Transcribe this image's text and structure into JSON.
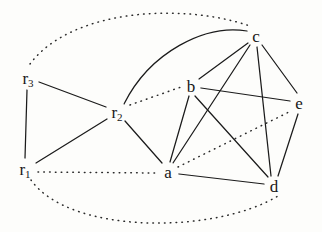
{
  "figure": {
    "width": 322,
    "height": 232,
    "background": "#fdfdfb",
    "stroke_color": "#1b1b1b",
    "dotted_color": "#2a2a2a"
  },
  "nodes": [
    {
      "id": "r3",
      "label": "r",
      "sub": "3",
      "x": 28,
      "y": 78
    },
    {
      "id": "r2",
      "label": "r",
      "sub": "2",
      "x": 117,
      "y": 112
    },
    {
      "id": "r1",
      "label": "r",
      "sub": "1",
      "x": 25,
      "y": 169
    },
    {
      "id": "b",
      "label": "b",
      "sub": "",
      "x": 191,
      "y": 86
    },
    {
      "id": "c",
      "label": "c",
      "sub": "",
      "x": 256,
      "y": 36
    },
    {
      "id": "e",
      "label": "e",
      "sub": "",
      "x": 299,
      "y": 103
    },
    {
      "id": "a",
      "label": "a",
      "sub": "",
      "x": 168,
      "y": 172
    },
    {
      "id": "d",
      "label": "d",
      "sub": "",
      "x": 274,
      "y": 186
    }
  ],
  "edges_solid": [
    {
      "from": "r3",
      "to": "r1",
      "kind": "line"
    },
    {
      "from": "r3",
      "to": "r2",
      "kind": "line"
    },
    {
      "from": "r1",
      "to": "r2",
      "kind": "line"
    },
    {
      "from": "r2",
      "to": "a",
      "kind": "line"
    },
    {
      "from": "r2",
      "to": "c",
      "kind": "curve"
    },
    {
      "from": "b",
      "to": "c",
      "kind": "line"
    },
    {
      "from": "b",
      "to": "e",
      "kind": "line"
    },
    {
      "from": "b",
      "to": "a",
      "kind": "line"
    },
    {
      "from": "b",
      "to": "d",
      "kind": "line"
    },
    {
      "from": "c",
      "to": "a",
      "kind": "line"
    },
    {
      "from": "c",
      "to": "d",
      "kind": "line"
    },
    {
      "from": "c",
      "to": "e",
      "kind": "line"
    },
    {
      "from": "a",
      "to": "d",
      "kind": "line"
    },
    {
      "from": "d",
      "to": "e",
      "kind": "line"
    }
  ],
  "edges_dotted": [
    {
      "from": "r3",
      "to": "c",
      "kind": "arc-top"
    },
    {
      "from": "r2",
      "to": "b",
      "kind": "line"
    },
    {
      "from": "r1",
      "to": "a",
      "kind": "line"
    },
    {
      "from": "r1",
      "to": "d",
      "kind": "arc-bottom"
    },
    {
      "from": "a",
      "to": "e",
      "kind": "line"
    }
  ],
  "legend": {
    "solid_meaning": "solid edge",
    "dotted_meaning": "dotted edge"
  }
}
